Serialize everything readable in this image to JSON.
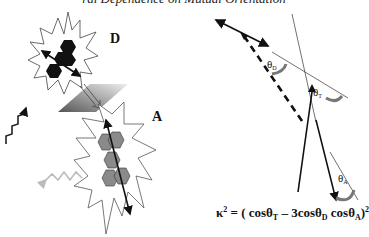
{
  "title": "ral Dependence on Mutual Orientation",
  "labels": {
    "donor": "D",
    "acceptor": "A"
  },
  "angles": {
    "theta_D": {
      "symbol": "θ",
      "sub": "D"
    },
    "theta_T": {
      "symbol": "θ",
      "sub": "T"
    },
    "theta_A": {
      "symbol": "θ",
      "sub": "A"
    }
  },
  "formula": {
    "lhs": "κ",
    "lhs_sup": "2",
    "eq": " = ( cosθ",
    "t1_sub": "T",
    "mid": " – 3cosθ",
    "t2_sub": "D",
    "mid2": " cosθ",
    "t3_sub": "A",
    "rhs": ")",
    "rhs_sup": "2"
  },
  "colors": {
    "donor_fill": "#111111",
    "acceptor_fill": "#8a8a8a",
    "arrow": "#111111",
    "emission_wave": "#bbbbbb",
    "plane_dark": "#555555",
    "plane_light": "#e0e0e0"
  }
}
